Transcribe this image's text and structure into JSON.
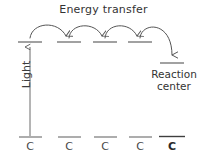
{
  "diagram": {
    "title": "Energy transfer",
    "light_label": "Light",
    "reaction_center": {
      "line1": "Reaction",
      "line2": "center"
    },
    "colors": {
      "stroke": "#555555",
      "text": "#333333",
      "background": "#ffffff"
    },
    "pigment_labels": [
      {
        "label": "C",
        "emphasis": false
      },
      {
        "label": "C",
        "emphasis": false
      },
      {
        "label": "C",
        "emphasis": false
      },
      {
        "label": "C",
        "emphasis": false
      },
      {
        "label": "C",
        "emphasis": true
      }
    ],
    "excited_levels": [
      {
        "name": "excited-level-1",
        "x_center": 30,
        "y": 42,
        "half_width": 12
      },
      {
        "name": "excited-level-2",
        "x_center": 69,
        "y": 42,
        "half_width": 12
      },
      {
        "name": "excited-level-3",
        "x_center": 105,
        "y": 42,
        "half_width": 12
      },
      {
        "name": "excited-level-4",
        "x_center": 140,
        "y": 42,
        "half_width": 12
      },
      {
        "name": "reaction-center-level",
        "x_center": 172,
        "y": 63,
        "half_width": 12
      }
    ],
    "ground_levels": [
      {
        "name": "ground-level-1",
        "x_center": 30,
        "y": 137,
        "half_width": 12
      },
      {
        "name": "ground-level-2",
        "x_center": 69,
        "y": 137,
        "half_width": 12
      },
      {
        "name": "ground-level-3",
        "x_center": 105,
        "y": 137,
        "half_width": 12
      },
      {
        "name": "ground-level-4",
        "x_center": 140,
        "y": 137,
        "half_width": 12
      },
      {
        "name": "ground-level-5",
        "x_center": 172,
        "y": 137,
        "half_width": 12
      }
    ],
    "light_arrow": {
      "x": 30,
      "y_from": 137,
      "y_to": 46
    },
    "transfer_arcs": [
      {
        "name": "transfer-arc-1",
        "from_x": 30,
        "to_x": 66
      },
      {
        "name": "transfer-arc-2",
        "from_x": 72,
        "to_x": 102
      },
      {
        "name": "transfer-arc-3",
        "from_x": 108,
        "to_x": 137
      },
      {
        "name": "transfer-arc-4",
        "from_x": 143,
        "to_x": 172
      }
    ]
  }
}
